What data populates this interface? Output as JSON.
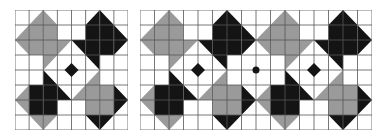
{
  "colors": {
    "W": "#ffffff",
    "G": "#9a9a9a",
    "D": "#141414",
    "grid": "#555555"
  },
  "tile": {
    "rows": 8,
    "cols": 8,
    "cells": [
      [
        "W",
        "br:G:W",
        "bl:G:W",
        "W",
        "W",
        "br:D:W",
        "bl:D:W",
        "W"
      ],
      [
        "br:G:W",
        "G",
        "G",
        "W",
        "W",
        "D",
        "D",
        "bl:D:W"
      ],
      [
        "tr:G:W",
        "G",
        "G",
        "tl:G:W",
        "tr:D:W",
        "D",
        "D",
        "tl:D:W"
      ],
      [
        "W",
        "W",
        "tl:G:W",
        "W",
        "W",
        "tr:D:W",
        "W",
        "W"
      ],
      [
        "W",
        "W",
        "bl:D:W",
        "W",
        "W",
        "br:G:W",
        "W",
        "W"
      ],
      [
        "br:G:W",
        "D",
        "D",
        "bl:D:W",
        "br:G:W",
        "G",
        "G",
        "bl:D:W"
      ],
      [
        "tr:G:W",
        "D",
        "D",
        "W",
        "W",
        "G",
        "G",
        "tl:D:W"
      ],
      [
        "W",
        "tr:G:W",
        "tl:G:W",
        "W",
        "W",
        "tr:D:W",
        "tl:D:W",
        "W"
      ]
    ],
    "center_diamond": {
      "color": "D",
      "radius_cells": 0.45
    }
  },
  "panels": [
    {
      "name": "single-tile-panel",
      "x": 15,
      "width": 113,
      "repeat": 1,
      "seam_dot": false
    },
    {
      "name": "double-tile-panel",
      "x": 140,
      "width": 232,
      "repeat": 2,
      "seam_dot": true
    }
  ]
}
